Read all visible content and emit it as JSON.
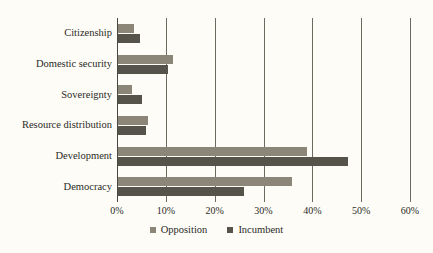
{
  "chart_data": {
    "type": "bar",
    "orientation": "horizontal",
    "title": "",
    "subtitle": "",
    "xlabel": "",
    "ylabel": "",
    "xlim": [
      0,
      60
    ],
    "xtick_labels": [
      "0%",
      "10%",
      "20%",
      "30%",
      "40%",
      "50%",
      "60%"
    ],
    "xticks": [
      0,
      10,
      20,
      30,
      40,
      50,
      60
    ],
    "grid": true,
    "legend_position": "bottom",
    "categories": [
      "Citizenship",
      "Domestic security",
      "Sovereignty",
      "Resource distribution",
      "Development",
      "Democracy"
    ],
    "series": [
      {
        "name": "Opposition",
        "color": "#8b8678",
        "values": [
          3.5,
          11.5,
          3.0,
          6.4,
          39.0,
          35.9
        ]
      },
      {
        "name": "Incumbent",
        "color": "#56534a",
        "values": [
          4.7,
          10.5,
          5.2,
          6.0,
          47.3,
          26.0
        ]
      }
    ]
  },
  "colors": {
    "background": "#fdfcf7",
    "gridline": "#6d6a60",
    "axis": "#4a4842",
    "text": "#2b2b26",
    "opposition": "#8b8678",
    "incumbent": "#56534a"
  }
}
